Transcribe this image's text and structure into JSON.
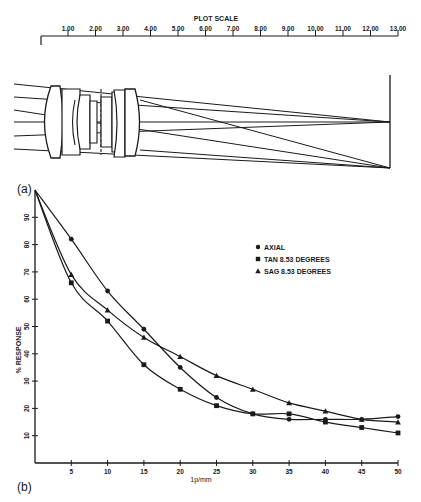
{
  "plot_scale": {
    "title": "PLOT SCALE",
    "ticks": [
      "1.00",
      "2.00",
      "3.00",
      "4.00",
      "5.00",
      "6.00",
      "7.00",
      "8.00",
      "9.00",
      "10.00",
      "11.00",
      "12.00",
      "13.00"
    ]
  },
  "panel_labels": {
    "a": "(a)",
    "b": "(b)"
  },
  "legend": [
    {
      "marker": "circle",
      "label": "AXIAL"
    },
    {
      "marker": "square",
      "label": "TAN 8.53 DEGREES"
    },
    {
      "marker": "triangle",
      "label": "SAG 8.53 DEGREES"
    }
  ],
  "chart_data": {
    "type": "line",
    "title": "",
    "xlabel": "1p/mm",
    "ylabel": "% RESPONSE",
    "x": [
      0,
      5,
      10,
      15,
      20,
      25,
      30,
      35,
      40,
      45,
      50
    ],
    "x_ticks": [
      "5",
      "10",
      "15",
      "20",
      "25",
      "30",
      "35",
      "40",
      "45",
      "50"
    ],
    "y_ticks": [
      "10",
      "20",
      "30",
      "40",
      "50",
      "60",
      "70",
      "80",
      "90"
    ],
    "xlim": [
      0,
      50
    ],
    "ylim": [
      0,
      100
    ],
    "grid": false,
    "legend_position": "upper right",
    "series": [
      {
        "name": "AXIAL",
        "marker": "circle",
        "values": [
          100,
          82,
          63,
          49,
          35,
          24,
          18,
          16,
          16,
          16,
          17
        ]
      },
      {
        "name": "TAN 8.53 DEGREES",
        "marker": "square",
        "values": [
          100,
          66,
          52,
          36,
          27,
          21,
          18,
          18,
          15,
          13,
          11
        ]
      },
      {
        "name": "SAG 8.53 DEGREES",
        "marker": "triangle",
        "values": [
          100,
          69,
          56,
          46,
          39,
          32,
          27,
          22,
          19,
          16,
          15
        ]
      }
    ]
  }
}
